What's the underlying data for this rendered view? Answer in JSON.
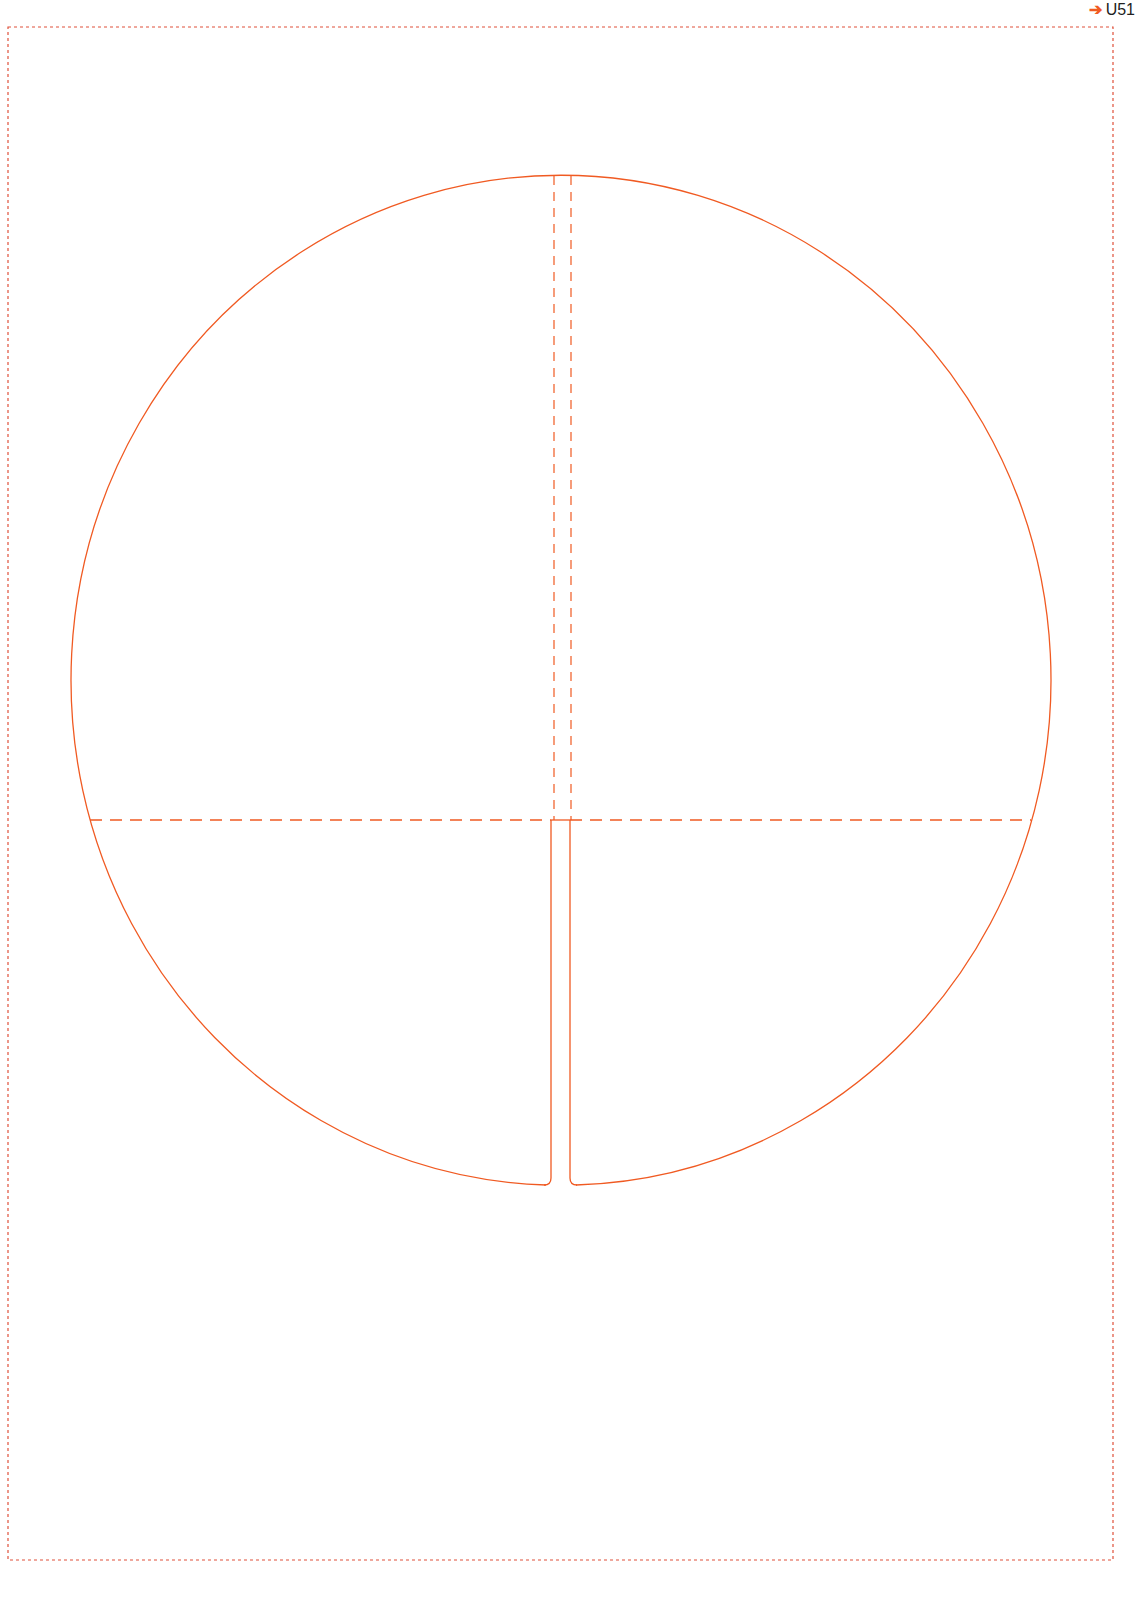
{
  "header": {
    "arrow_icon": "arrow-right-icon",
    "arrow_glyph": "➔",
    "code": "U51"
  },
  "colors": {
    "cut_line": "#f05a22",
    "fold_line": "#f05a22",
    "border": "#e0503a"
  },
  "diagram": {
    "type": "die-cut template",
    "shape": "circle with center slot",
    "lines": [
      "cut",
      "fold (dashed)",
      "page border (dotted)"
    ]
  }
}
